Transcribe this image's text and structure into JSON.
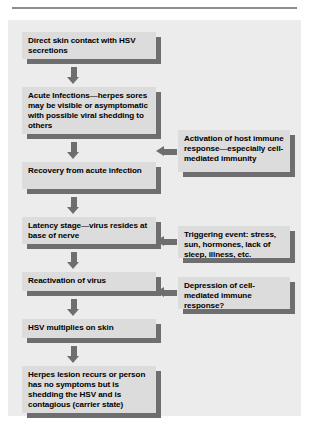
{
  "figure": {
    "colors": {
      "page_background": "#ffffff",
      "panel_background": "#ececed",
      "box_fill": "#dcdcdc",
      "shadow": "#6e6e70",
      "arrow": "#6e6e70",
      "rule": "#8d8d8d",
      "text": "#000000"
    }
  },
  "flow": {
    "steps": [
      {
        "id": "step-1",
        "text": "Direct skin contact with HSV secretions"
      },
      {
        "id": "step-2",
        "text": "Acute Infections—herpes sores may be visible or asymptomatic with possible viral shedding to others"
      },
      {
        "id": "step-3",
        "text": "Recovery from acute infection"
      },
      {
        "id": "step-4",
        "text": "Latency stage—virus resides at base of nerve"
      },
      {
        "id": "step-5",
        "text": "Reactivation of virus"
      },
      {
        "id": "step-6",
        "text": "HSV multiplies on skin"
      },
      {
        "id": "step-7",
        "text": "Herpes lesion recurs or person has no symptoms but is shedding the HSV and is contagious (carrier state)"
      }
    ]
  },
  "annotations": {
    "notes": [
      {
        "id": "note-1",
        "text": "Activation of host immune response—especially cell-mediated immunity",
        "targets": "step-2"
      },
      {
        "id": "note-2",
        "text": "Triggering event: stress, sun, hormones, lack of sleep, illness, etc.",
        "targets": "step-4"
      },
      {
        "id": "note-3",
        "text": "Depression of cell-mediated immune response?",
        "targets": "step-5"
      }
    ]
  }
}
